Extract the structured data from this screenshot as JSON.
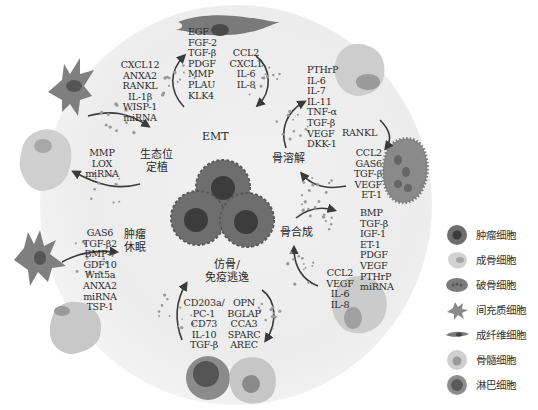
{
  "diagram": {
    "center": {
      "name": "肿瘤细胞簇"
    },
    "processes": {
      "emt": "EMT",
      "niche_line1": "生态位",
      "niche_line2": "定植",
      "dormancy_line1": "肿瘤",
      "dormancy_line2": "休眠",
      "osteolysis": "骨溶解",
      "osteogenesis": "骨合成",
      "mimicry_line1": "仿骨/",
      "mimicry_line2": "免疫逃逸",
      "rankl": "RANKL"
    },
    "factor_lists": {
      "mesenchymal_top_left": [
        "CXCL12",
        "ANXA2",
        "RANKL",
        "IL-1β",
        "WISP-1",
        "miRNA"
      ],
      "emt_outgoing": [
        "EGF",
        "FGF-2",
        "TGF-β",
        "PDGF",
        "MMP",
        "PLAU",
        "KLK4"
      ],
      "emt_incoming": [
        "CCL2",
        "CXCL1",
        "IL-6",
        "IL-8"
      ],
      "osteoblast_top_right": [
        "PTHrP",
        "IL-6",
        "IL-7",
        "IL-11",
        "TNF-α",
        "TGF-β",
        "VEGF",
        "DKK-1"
      ],
      "osteoclast_right": [
        "CCL2",
        "GAS6",
        "TGF-β",
        "VEGF",
        "ET-1"
      ],
      "niche_left": [
        "MMP",
        "LOX",
        "miRNA"
      ],
      "dormancy_left": [
        "GAS6",
        "TGF-β2",
        "BMP-7",
        "GDF10",
        "Wnt5a",
        "ANXA2",
        "miRNA",
        "TSP-1"
      ],
      "osteogenesis_right": [
        "BMP",
        "TGF-β",
        "IGF-1",
        "ET-1",
        "PDGF",
        "VEGF",
        "PTHrP",
        "miRNA"
      ],
      "fibro_lower_right": [
        "CCL2",
        "VEGF",
        "IL-6",
        "IL-8"
      ],
      "immune_bottom_left": [
        "CD203a/",
        "PC-1",
        "CD73",
        "IL-10",
        "TGF-β"
      ],
      "bone_marrow_bottom": [
        "OPN",
        "BGLAP",
        "CCA3",
        "SPARC",
        "AREC"
      ]
    }
  },
  "legend": {
    "items": [
      {
        "icon": "tumor-cell-icon",
        "label": "肿瘤细胞"
      },
      {
        "icon": "osteoblast-icon",
        "label": "成骨细胞"
      },
      {
        "icon": "osteoclast-icon",
        "label": "破骨细胞"
      },
      {
        "icon": "mesenchymal-cell-icon",
        "label": "间充质细胞"
      },
      {
        "icon": "fibroblast-icon",
        "label": "成纤维细胞"
      },
      {
        "icon": "bone-marrow-cell-icon",
        "label": "骨髓细胞"
      },
      {
        "icon": "lymphocyte-icon",
        "label": "淋巴细胞"
      }
    ]
  },
  "colors": {
    "tumor": "#6e6e6e",
    "tumor_nucleus": "#3c3c3c",
    "light_cell": "#c9c9c9",
    "mid_cell": "#8a8a8a",
    "arrow": "#3a3a3a",
    "dots": "#9a9a9a"
  }
}
